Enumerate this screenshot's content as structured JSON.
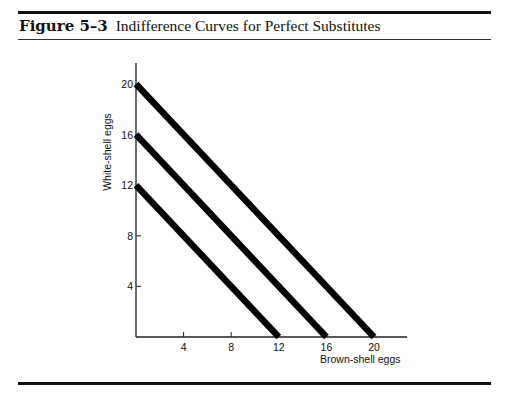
{
  "figure": {
    "number_label": "Figure 5–3",
    "title": "Indifference Curves for Perfect Substitutes"
  },
  "chart_data": {
    "type": "line",
    "title": "Indifference Curves for Perfect Substitutes",
    "xlabel": "Brown-shell eggs",
    "ylabel": "White-shell eggs",
    "xlim": [
      0,
      22
    ],
    "ylim": [
      0,
      21.5
    ],
    "grid": false,
    "legend": "none",
    "x_ticks": [
      4,
      8,
      12,
      16,
      20
    ],
    "y_ticks": [
      4,
      8,
      12,
      16,
      20
    ],
    "series": [
      {
        "name": "Indifference curve 1",
        "x": [
          0,
          12
        ],
        "y": [
          12,
          0
        ]
      },
      {
        "name": "Indifference curve 2",
        "x": [
          0,
          16
        ],
        "y": [
          16,
          0
        ]
      },
      {
        "name": "Indifference curve 3",
        "x": [
          0,
          20
        ],
        "y": [
          20,
          0
        ]
      }
    ],
    "line_color": "#000000"
  }
}
